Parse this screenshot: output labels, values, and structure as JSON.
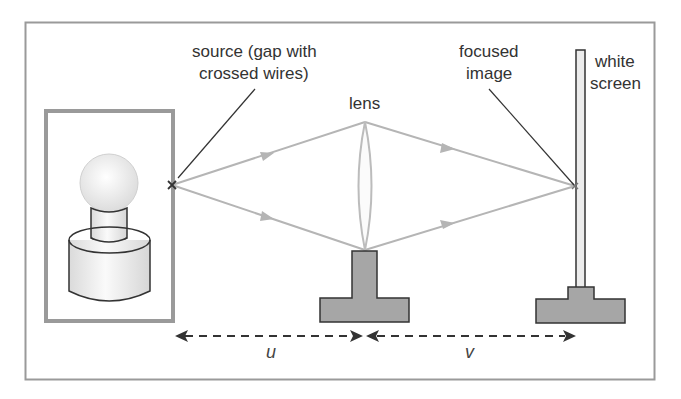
{
  "diagram": {
    "type": "optics-setup",
    "labels": {
      "source_line1": "source (gap with",
      "source_line2": "crossed wires)",
      "lens": "lens",
      "focused_line1": "focused",
      "focused_line2": "image",
      "screen_line1": "white",
      "screen_line2": "screen",
      "u": "u",
      "v": "v"
    },
    "colors": {
      "frame": "#9a9a9a",
      "rays": "#b5b5b5",
      "stand_fill": "#a6a6a6",
      "stand_stroke": "#333333",
      "pointer_line": "#333333"
    }
  }
}
